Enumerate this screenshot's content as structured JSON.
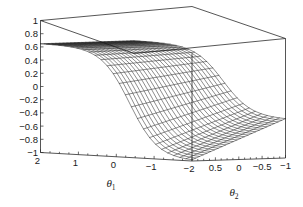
{
  "figure": {
    "type": "surface-plot-3d",
    "background_color": "#ffffff",
    "line_color": "#1b1b1b"
  },
  "chart_data": {
    "type": "surface",
    "render": "wireframe-mesh",
    "title": "",
    "xlabel": "θ₁",
    "ylabel": "θ₂",
    "zlabel": "",
    "grid": false,
    "legend": null,
    "projection": {
      "description": "3D box with z vertical at left, theta1 receding to lower-right, theta2 extending to the right"
    },
    "axes": {
      "z": {
        "label": "",
        "lim": [
          -1,
          1
        ],
        "ticks": [
          1,
          0.8,
          0.6,
          0.4,
          0.2,
          0,
          -0.2,
          -0.4,
          -0.6,
          -0.8,
          -1
        ],
        "tick_labels": [
          "1",
          "0.8",
          "0.6",
          "0.4",
          "0.2",
          "0",
          "−0.2",
          "−0.4",
          "−0.6",
          "−0.8",
          "−1"
        ]
      },
      "theta1": {
        "label": "θ₁",
        "lim": [
          2,
          -2
        ],
        "ticks": [
          2,
          1,
          0,
          -1,
          -2
        ],
        "tick_labels": [
          "2",
          "1",
          "0",
          "−1",
          "−2"
        ]
      },
      "theta2": {
        "label": "θ₂",
        "lim": [
          1,
          -1
        ],
        "ticks": [
          0.5,
          0,
          -0.5,
          -1
        ],
        "tick_labels": [
          "0.5",
          "0",
          "−0.5",
          "−1"
        ]
      }
    },
    "surface": {
      "description": "Smooth monotone sigmoid-like ridge: high plateau near z = 0.65 at theta1 = 2, falling through zero and reaching a trough near z = -1, then rising back toward z = -0.3 at the far theta2 edge",
      "z_plateau_high": 0.65,
      "z_trough_min": -1.0,
      "z_far_edge": -0.3,
      "grid_n_theta1": 26,
      "grid_n_theta2": 26
    }
  },
  "labels": {
    "z_ticks": [
      "1",
      "0.8",
      "0.6",
      "0.4",
      "0.2",
      "0",
      "−0.2",
      "−0.4",
      "−0.6",
      "−0.8",
      "−1"
    ],
    "theta1_ticks": [
      "2",
      "1",
      "0",
      "−1",
      "−2"
    ],
    "theta2_ticks": [
      "0.5",
      "0",
      "−0.5",
      "−1"
    ],
    "theta1_title_base": "θ",
    "theta1_title_sub": "1",
    "theta2_title_base": "θ",
    "theta2_title_sub": "2"
  }
}
